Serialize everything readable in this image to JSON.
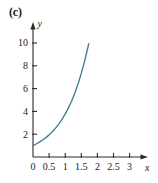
{
  "figure": {
    "panel_label": "(c)",
    "curve_color": "#3c7f91",
    "axis_color": "#2b2b2b",
    "background": "#ffffff"
  },
  "chart_data": {
    "type": "line",
    "title": "(c)",
    "xlabel": "x",
    "ylabel": "y",
    "xlim": [
      0,
      3.2
    ],
    "ylim": [
      0,
      11
    ],
    "grid": false,
    "legend": null,
    "xticks": [
      0,
      0.5,
      1,
      1.5,
      2,
      2.5,
      3
    ],
    "xtick_labels": [
      "0",
      "0.5",
      "1",
      "1.5",
      "2",
      "2.5",
      "3"
    ],
    "yticks": [
      2,
      4,
      6,
      8,
      10
    ],
    "ytick_labels": [
      "2",
      "4",
      "6",
      "8",
      "10"
    ],
    "series": [
      {
        "name": "exponential",
        "color": "#3c7f91",
        "x": [
          0,
          0.1,
          0.2,
          0.3,
          0.4,
          0.5,
          0.6,
          0.7,
          0.8,
          0.9,
          1.0,
          1.1,
          1.2,
          1.3,
          1.4,
          1.5,
          1.6,
          1.7,
          1.73
        ],
        "y": [
          1.0,
          1.14,
          1.3,
          1.49,
          1.7,
          1.94,
          2.22,
          2.53,
          2.89,
          3.3,
          3.78,
          4.31,
          4.92,
          5.62,
          6.42,
          7.33,
          8.37,
          9.56,
          9.94
        ]
      }
    ]
  },
  "labels": {
    "x_axis_name": "x",
    "y_axis_name": "y"
  }
}
